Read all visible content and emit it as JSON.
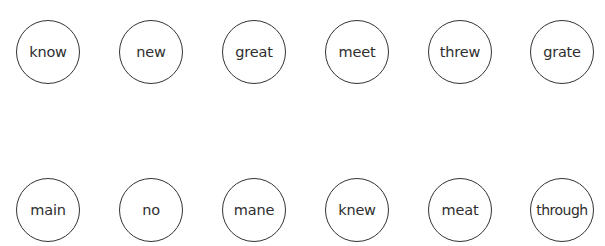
{
  "rows": [
    {
      "words": [
        "know",
        "new",
        "great",
        "meet",
        "threw",
        "grate"
      ]
    },
    {
      "words": [
        "main",
        "no",
        "mane",
        "knew",
        "meat",
        "through"
      ]
    }
  ],
  "colors": {
    "circle_border": "#333333",
    "text": "#2e2e2e",
    "background": "#ffffff"
  }
}
